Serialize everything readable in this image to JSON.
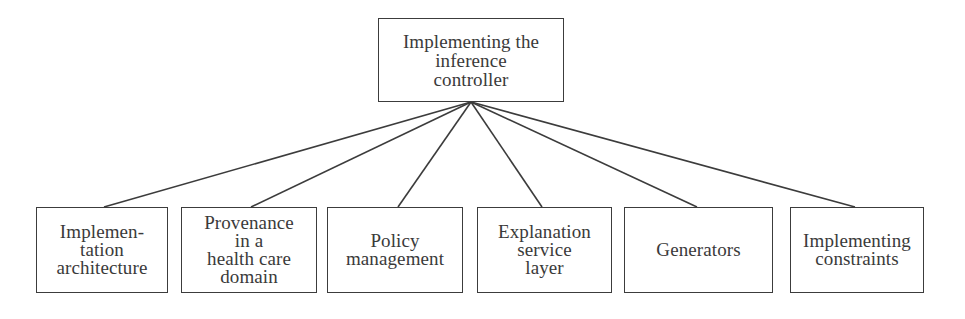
{
  "diagram": {
    "type": "tree",
    "colors": {
      "line": "#3c3c3c",
      "text": "#3a3a3a",
      "background": "#ffffff"
    },
    "root": {
      "id": "root",
      "label": "Implementing the\ninference\ncontroller",
      "box": {
        "x": 378,
        "y": 18,
        "w": 186,
        "h": 84
      },
      "anchor": {
        "x": 471,
        "y": 102
      }
    },
    "children": [
      {
        "id": "implementation-architecture",
        "label": "Implemen-\ntation\narchitecture",
        "box": {
          "x": 36,
          "y": 207,
          "w": 132,
          "h": 86
        },
        "anchor": {
          "x": 104,
          "y": 207
        }
      },
      {
        "id": "provenance-health-care",
        "label": "Provenance\nin a\nhealth care\ndomain",
        "box": {
          "x": 181,
          "y": 207,
          "w": 136,
          "h": 86
        },
        "anchor": {
          "x": 251,
          "y": 207
        }
      },
      {
        "id": "policy-management",
        "label": "Policy\nmanagement",
        "box": {
          "x": 327,
          "y": 207,
          "w": 136,
          "h": 86
        },
        "anchor": {
          "x": 398,
          "y": 207
        }
      },
      {
        "id": "explanation-service-layer",
        "label": "Explanation\nservice\nlayer",
        "box": {
          "x": 477,
          "y": 207,
          "w": 135,
          "h": 86
        },
        "anchor": {
          "x": 542,
          "y": 207
        }
      },
      {
        "id": "generators",
        "label": "Generators",
        "box": {
          "x": 624,
          "y": 207,
          "w": 149,
          "h": 86
        },
        "anchor": {
          "x": 697,
          "y": 207
        }
      },
      {
        "id": "implementing-constraints",
        "label": "Implementing\nconstraints",
        "box": {
          "x": 790,
          "y": 207,
          "w": 134,
          "h": 86
        },
        "anchor": {
          "x": 855,
          "y": 207
        }
      }
    ]
  }
}
